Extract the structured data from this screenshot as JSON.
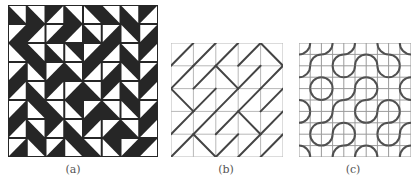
{
  "figure": {
    "panels": [
      {
        "id": "a",
        "label": "(a)",
        "kind": "triangle-tiling",
        "grid": 8,
        "colors": {
          "fill": "#262626",
          "background": "#ffffff",
          "line": "#bfbfbf"
        },
        "white_corners": [
          [
            "TR",
            "TR",
            "BR",
            "TR",
            "BL",
            "TR",
            "TR",
            "BR"
          ],
          [
            "TL",
            "BR",
            "TL",
            "BR",
            "TR",
            "TL",
            "BL",
            "TL"
          ],
          [
            "BL",
            "TR",
            "TR",
            "BL",
            "TL",
            "BR",
            "TR",
            "BR"
          ],
          [
            "TL",
            "BL",
            "TL",
            "TR",
            "BR",
            "TL",
            "BL",
            "TL"
          ],
          [
            "BR",
            "TR",
            "BR",
            "TL",
            "TR",
            "BR",
            "TR",
            "BR"
          ],
          [
            "TL",
            "BL",
            "TR",
            "BL",
            "TL",
            "TR",
            "BL",
            "TL"
          ],
          [
            "BR",
            "TR",
            "BR",
            "TR",
            "BR",
            "TL",
            "TR",
            "BR"
          ],
          [
            "TL",
            "BL",
            "TL",
            "BL",
            "TR",
            "BL",
            "TL",
            "BR"
          ]
        ]
      },
      {
        "id": "b",
        "label": "(b)",
        "kind": "diagonal-tiling",
        "grid": 5,
        "colors": {
          "grid": "#b8b8b8",
          "line": "#444444"
        },
        "diagonals": [
          [
            "/",
            "/",
            "/",
            "/",
            "\\"
          ],
          [
            "/",
            "/",
            "\\",
            "/",
            "/"
          ],
          [
            "\\",
            "/",
            "/",
            "/",
            "/"
          ],
          [
            "/",
            "/",
            "/",
            "\\",
            "/"
          ],
          [
            "/",
            "\\",
            "/",
            "/",
            "/"
          ]
        ]
      },
      {
        "id": "c",
        "label": "(c)",
        "kind": "truchet-arc-tiling",
        "grid": 5,
        "colors": {
          "grid": "#9a9a9a",
          "arc": "#505050"
        },
        "arc_types": [
          [
            "A",
            "A",
            "A",
            "B",
            "B"
          ],
          [
            "A",
            "B",
            "A",
            "B",
            "A"
          ],
          [
            "B",
            "A",
            "A",
            "A",
            "B"
          ],
          [
            "A",
            "A",
            "B",
            "A",
            "A"
          ],
          [
            "B",
            "A",
            "A",
            "B",
            "A"
          ]
        ]
      }
    ]
  }
}
